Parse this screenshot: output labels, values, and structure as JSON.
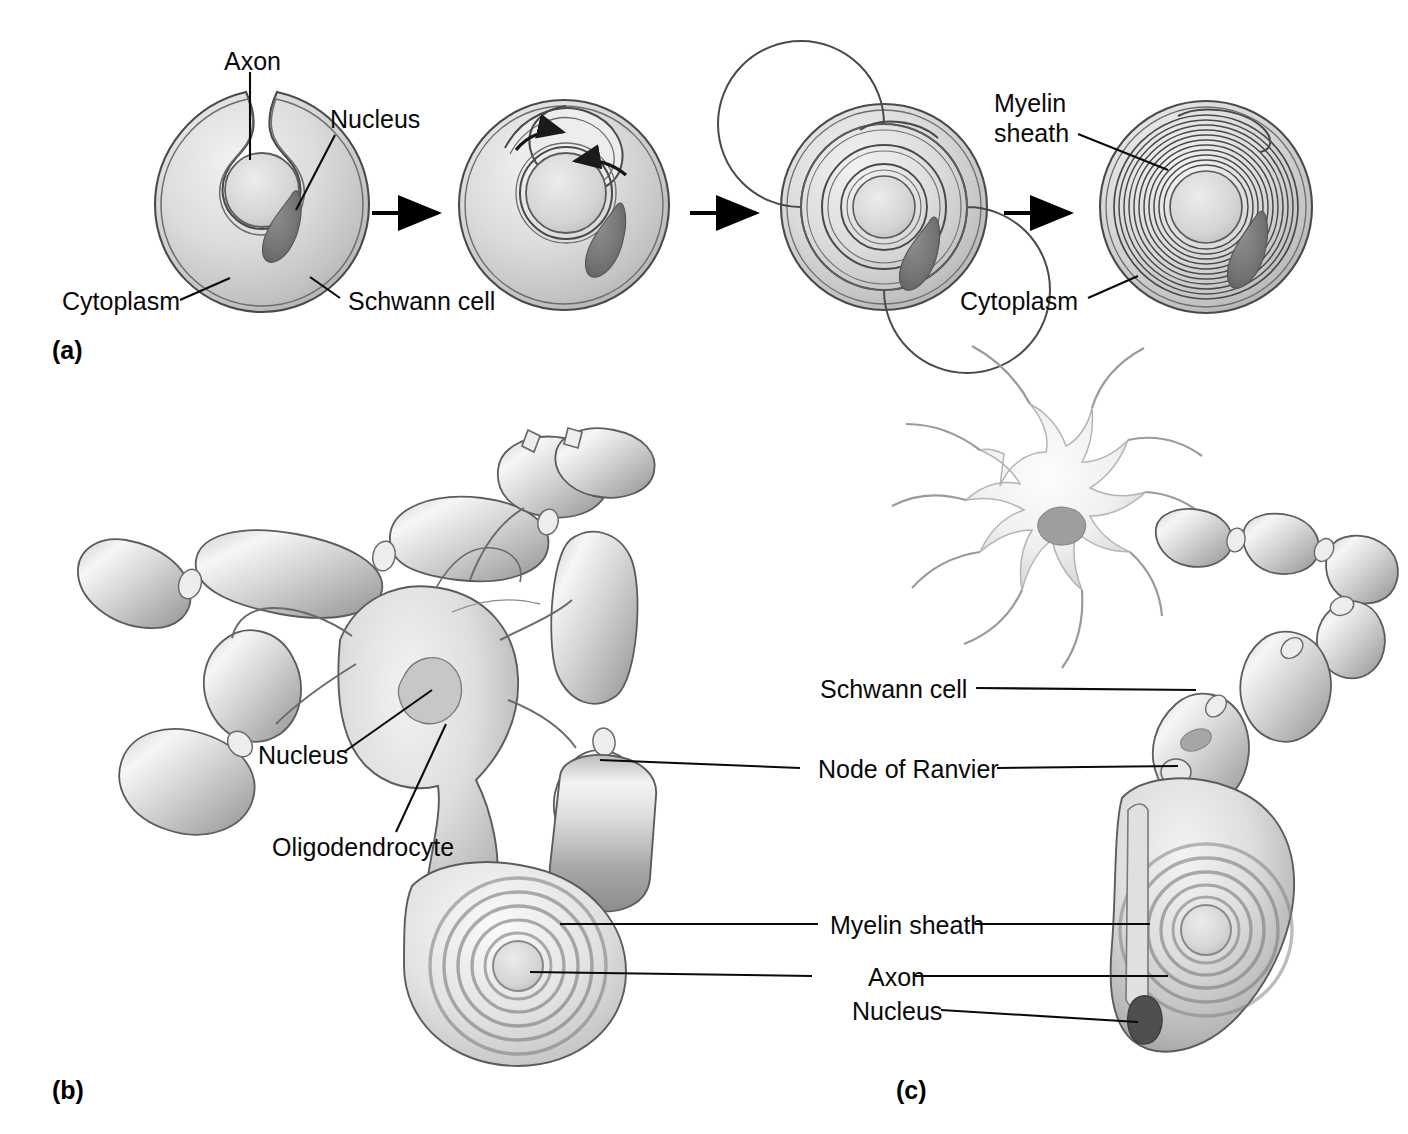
{
  "figure": {
    "background_color": "#ffffff",
    "ink_color": "#0a0a0a"
  },
  "panels": [
    {
      "id": "a",
      "tag": "(a)",
      "caption": "Stages of myelin sheath formation by a Schwann cell wrapping around an axon"
    },
    {
      "id": "b",
      "tag": "(b)",
      "caption": "Oligodendrocyte myelinating several axons in the central nervous system"
    },
    {
      "id": "c",
      "tag": "(c)",
      "caption": "Neuron with axon myelinated by Schwann cells in the peripheral nervous system"
    }
  ],
  "panel_a": {
    "tag": "(a)",
    "stage_count": 4,
    "arrows": 3,
    "labels": [
      {
        "name": "axon",
        "text": "Axon"
      },
      {
        "name": "nucleus",
        "text": "Nucleus"
      },
      {
        "name": "cytoplasm",
        "text": "Cytoplasm"
      },
      {
        "name": "schwann-cell",
        "text": "Schwann cell"
      },
      {
        "name": "myelin-sheath-line1",
        "text": "Myelin"
      },
      {
        "name": "myelin-sheath-line2",
        "text": "sheath"
      },
      {
        "name": "cytoplasm-right",
        "text": "Cytoplasm"
      }
    ],
    "stages": [
      {
        "index": 1,
        "wraps": 0,
        "description": "Schwann cell engulfs axon in a groove"
      },
      {
        "index": 2,
        "wraps": 1,
        "description": "Cell edge begins to spiral around the axon"
      },
      {
        "index": 3,
        "wraps": 3,
        "description": "Membrane spirals several times around the axon"
      },
      {
        "index": 4,
        "wraps": 14,
        "description": "Compact multilayered myelin sheath formed"
      }
    ]
  },
  "panel_b": {
    "tag": "(b)",
    "labels": [
      {
        "name": "nucleus",
        "text": "Nucleus"
      },
      {
        "name": "oligodendrocyte",
        "text": "Oligodendrocyte"
      }
    ],
    "internode_segments": 7,
    "description": "One oligodendrocyte extends processes to myelinate many axon internodes"
  },
  "panel_c": {
    "tag": "(c)",
    "labels": [
      {
        "name": "schwann-cell",
        "text": "Schwann cell"
      },
      {
        "name": "node-of-ranvier",
        "text": "Node of Ranvier"
      },
      {
        "name": "myelin-sheath",
        "text": "Myelin sheath"
      },
      {
        "name": "axon",
        "text": "Axon"
      },
      {
        "name": "nucleus",
        "text": "Nucleus"
      }
    ],
    "soma": {
      "dendrite_count": 9,
      "has_nucleus": true
    },
    "internode_segments": 6,
    "description": "Neuron cell body with dendrites; axon wrapped by successive Schwann cells"
  },
  "shared_labels": {
    "note": "Myelin sheath and Axon labels carry leader lines to both panel (b) and panel (c)"
  }
}
